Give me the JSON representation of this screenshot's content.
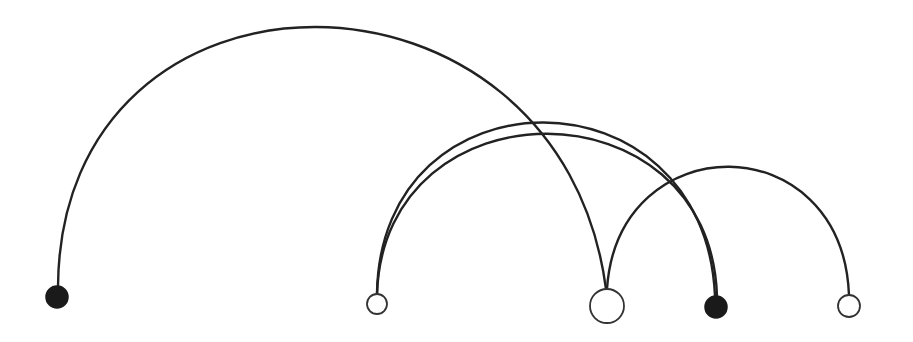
{
  "diagram": {
    "type": "arc-diagram",
    "background": "#ffffff",
    "stroke_color": "#222222",
    "nodes": [
      {
        "id": "n1",
        "cx": 57,
        "cy": 297,
        "r": 11,
        "style": "filled"
      },
      {
        "id": "n2",
        "cx": 377,
        "cy": 304,
        "r": 10,
        "style": "open"
      },
      {
        "id": "n3",
        "cx": 607,
        "cy": 306,
        "r": 17,
        "style": "open"
      },
      {
        "id": "n4",
        "cx": 716,
        "cy": 307,
        "r": 11,
        "style": "filled"
      },
      {
        "id": "n5",
        "cx": 849,
        "cy": 306,
        "r": 11,
        "style": "open"
      }
    ],
    "edges": [
      {
        "from": "n1",
        "to": "n3",
        "d": "M 58 287 C 60 -60, 560 -60, 606 289"
      },
      {
        "from": "n2",
        "to": "n4",
        "d": "M 377 294 C 380 65, 705 65, 715 296"
      },
      {
        "from": "n2",
        "to": "n4",
        "d": "M 377 294 C 384 80, 710 80, 717 296"
      },
      {
        "from": "n3",
        "to": "n5",
        "d": "M 607 289 C 618 125, 842 125, 849 295"
      }
    ]
  }
}
